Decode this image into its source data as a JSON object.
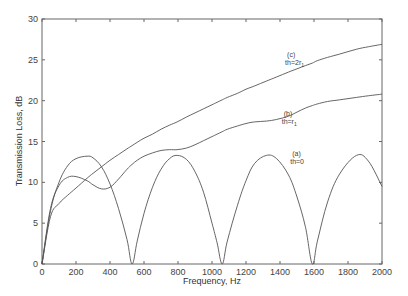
{
  "chart_data": {
    "type": "line",
    "title": "",
    "xlabel": "Frequency, Hz",
    "ylabel": "Transmission Loss, dB",
    "xlim": [
      0,
      2000
    ],
    "ylim": [
      0,
      30
    ],
    "xticks": [
      0,
      200,
      400,
      600,
      800,
      1000,
      1200,
      1400,
      1600,
      1800,
      2000
    ],
    "yticks": [
      0,
      5,
      10,
      15,
      20,
      25,
      30
    ],
    "grid": false,
    "legend": null,
    "x": [
      0,
      50,
      100,
      150,
      200,
      265,
      300,
      350,
      400,
      450,
      500,
      530,
      560,
      600,
      650,
      700,
      750,
      795,
      850,
      900,
      950,
      1000,
      1030,
      1060,
      1090,
      1150,
      1200,
      1250,
      1320,
      1380,
      1450,
      1500,
      1550,
      1590,
      1620,
      1680,
      1750,
      1850,
      1920,
      2000
    ],
    "series": [
      {
        "name": "(a) th=0",
        "label_line1": "(a)",
        "label_line2": "th=0",
        "values": [
          0,
          6.5,
          10.0,
          12.0,
          12.9,
          13.2,
          13.0,
          11.9,
          9.8,
          6.8,
          3.0,
          0,
          2.8,
          6.2,
          9.4,
          11.6,
          12.9,
          13.3,
          12.8,
          11.3,
          8.8,
          5.0,
          2.6,
          0,
          2.8,
          7.2,
          10.2,
          12.3,
          13.3,
          12.9,
          10.9,
          8.2,
          4.5,
          0,
          2.8,
          7.6,
          11.0,
          13.3,
          12.6,
          9.5
        ]
      },
      {
        "name": "(b) th=r1",
        "label_line1": "(b)",
        "label_line2": "th=r",
        "label_sub": "1",
        "values": [
          0,
          6.8,
          9.6,
          10.6,
          10.7,
          10.2,
          9.7,
          9.2,
          9.4,
          10.4,
          11.6,
          12.2,
          12.7,
          13.2,
          13.6,
          13.9,
          14.0,
          14.0,
          14.2,
          14.6,
          15.1,
          15.6,
          15.9,
          16.2,
          16.5,
          16.9,
          17.2,
          17.4,
          17.5,
          17.7,
          18.1,
          18.6,
          19.1,
          19.4,
          19.6,
          19.9,
          20.1,
          20.4,
          20.6,
          20.8
        ]
      },
      {
        "name": "(c) th=2r1",
        "label_line1": "(c)",
        "label_line2": "th=2r",
        "label_sub": "1",
        "values": [
          0,
          5.8,
          7.4,
          8.4,
          9.3,
          10.5,
          11.1,
          11.9,
          12.7,
          13.4,
          14.1,
          14.5,
          14.9,
          15.4,
          15.9,
          16.5,
          17.0,
          17.4,
          18.0,
          18.5,
          19.0,
          19.5,
          19.8,
          20.1,
          20.4,
          20.9,
          21.4,
          21.8,
          22.4,
          22.9,
          23.5,
          23.9,
          24.3,
          24.6,
          24.9,
          25.3,
          25.7,
          26.3,
          26.6,
          26.9
        ]
      }
    ],
    "annotations": [
      {
        "series": "(c)",
        "line1": "(c)",
        "line2": "th=2r",
        "sub": "1",
        "x_hz": 1430,
        "y_db": 24.4
      },
      {
        "series": "(b)",
        "line1": "(b)",
        "line2": "th=r",
        "sub": "1",
        "x_hz": 1410,
        "y_db": 17.2
      },
      {
        "series": "(a)",
        "line1": "(a)",
        "line2": "th=0",
        "x_hz": 1460,
        "y_db": 12.3
      }
    ]
  },
  "axes": {
    "xlabel": "Frequency, Hz",
    "ylabel": "Transmission Loss, dB",
    "xtick_labels": [
      "0",
      "200",
      "400",
      "600",
      "800",
      "1000",
      "1200",
      "1400",
      "1600",
      "1800",
      "2000"
    ],
    "ytick_labels": [
      "0",
      "5",
      "10",
      "15",
      "20",
      "25",
      "30"
    ]
  },
  "style": {
    "line_color": "#555555",
    "axis_color": "#666666",
    "background": "#ffffff"
  }
}
